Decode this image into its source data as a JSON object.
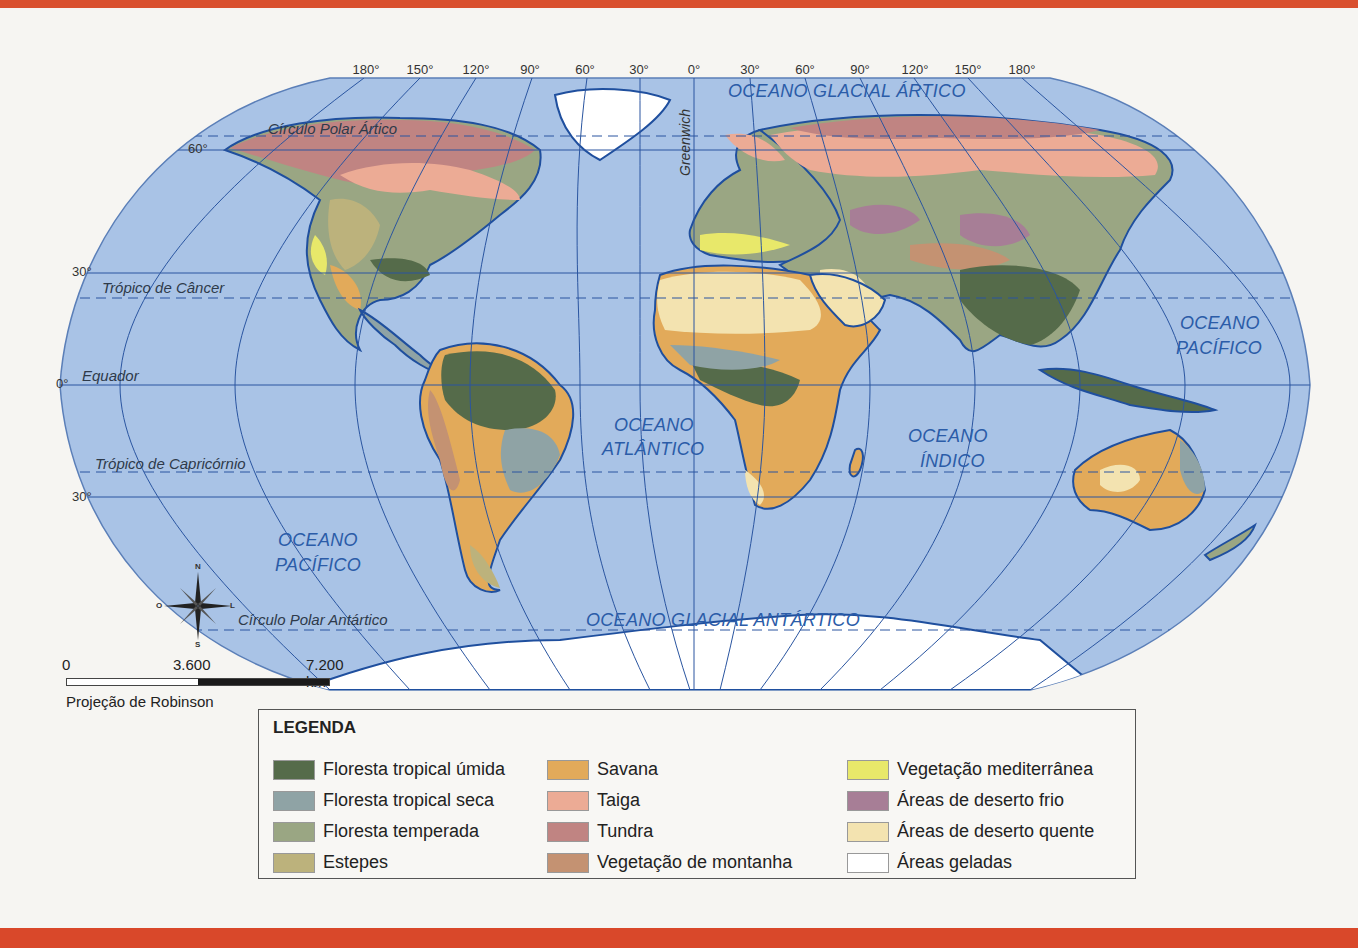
{
  "map": {
    "projection": "Projeção de Robinson",
    "longitude_labels": [
      "180°",
      "150°",
      "120°",
      "90°",
      "60°",
      "30°",
      "0°",
      "30°",
      "60°",
      "90°",
      "120°",
      "150°",
      "180°"
    ],
    "latitude_labels": {
      "lat60": "60°",
      "lat30n": "30°",
      "lat0": "0°",
      "lat30s": "30°"
    },
    "lines": {
      "arctic_circle": "Círculo Polar Ártico",
      "tropic_cancer": "Trópico de Câncer",
      "equator": "Equador",
      "tropic_capricorn": "Trópico de Capricórnio",
      "antarctic_circle": "Círculo Polar Antártico",
      "greenwich": "Greenwich"
    },
    "oceans": {
      "arctic": "OCEANO GLACIAL ÁRTICO",
      "atlantic_1": "OCEANO",
      "atlantic_2": "ATLÂNTICO",
      "indian_1": "OCEANO",
      "indian_2": "ÍNDICO",
      "pacific_west_1": "OCEANO",
      "pacific_west_2": "PACÍFICO",
      "pacific_east_1": "OCEANO",
      "pacific_east_2": "PACÍFICO",
      "antarctic": "OCEANO GLACIAL ANTÁRTICO"
    },
    "compass": {
      "n": "N",
      "s": "S",
      "e": "L",
      "w": "O"
    },
    "scale": {
      "start": "0",
      "mid": "3.600",
      "end": "7.200 km"
    },
    "colors": {
      "ocean": "#a9c3e6",
      "grid": "#2a55a0",
      "coast": "#1f4f9e",
      "frame_red": "#d9502f"
    }
  },
  "legend": {
    "title": "LEGENDA",
    "columns": [
      [
        {
          "label": "Floresta tropical úmida",
          "color": "#556b4a"
        },
        {
          "label": "Floresta tropical seca",
          "color": "#8fa3a5"
        },
        {
          "label": "Floresta temperada",
          "color": "#9aa683"
        },
        {
          "label": "Estepes",
          "color": "#bcb27c"
        }
      ],
      [
        {
          "label": "Savana",
          "color": "#e2aa5a"
        },
        {
          "label": "Taiga",
          "color": "#ecab95"
        },
        {
          "label": "Tundra",
          "color": "#c08482"
        },
        {
          "label": "Vegetação de montanha",
          "color": "#c49272"
        }
      ],
      [
        {
          "label": "Vegetação mediterrânea",
          "color": "#e8e86a"
        },
        {
          "label": "Áreas de deserto frio",
          "color": "#a77e96"
        },
        {
          "label": "Áreas de deserto quente",
          "color": "#f3e3b0"
        },
        {
          "label": "Áreas geladas",
          "color": "#ffffff"
        }
      ]
    ]
  }
}
